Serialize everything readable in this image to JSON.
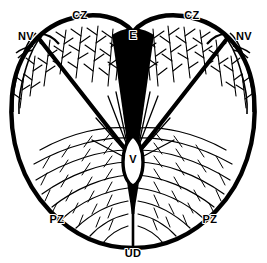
{
  "figure": {
    "background_color": "#ffffff",
    "ink_color": "#000000"
  },
  "labels": {
    "cz_left": "CZ",
    "cz_right": "CZ",
    "nv_left": "NV",
    "nv_right": "NV",
    "epidermis": "E",
    "vascular": "V",
    "pz_left": "PZ",
    "pz_right": "PZ",
    "underside": "UD"
  },
  "legend_meanings": {
    "CZ": "CZ",
    "NV": "NV",
    "E": "E",
    "V": "V",
    "PZ": "PZ",
    "UD": "UD"
  },
  "label_positions": {
    "cz_left": {
      "x": 80,
      "y": 15
    },
    "cz_right": {
      "x": 192,
      "y": 15
    },
    "nv_left": {
      "x": 26,
      "y": 36
    },
    "nv_right": {
      "x": 243,
      "y": 36
    },
    "epidermis": {
      "x": 133,
      "y": 36
    },
    "vascular": {
      "x": 133,
      "y": 158
    },
    "pz_left": {
      "x": 57,
      "y": 219
    },
    "pz_right": {
      "x": 210,
      "y": 219
    },
    "underside": {
      "x": 133,
      "y": 253
    }
  },
  "colors": {
    "outline": "#000000",
    "fill": "#ffffff",
    "wedge": "#000000",
    "label": "#000000"
  }
}
